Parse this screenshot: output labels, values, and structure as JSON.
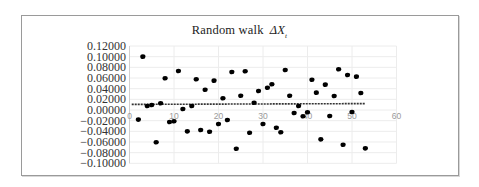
{
  "chart_data": {
    "type": "scatter",
    "title": "Random walk",
    "title_math": "ΔX",
    "title_subscript": "t",
    "xlabel": "",
    "ylabel": "",
    "xlim": [
      0,
      60
    ],
    "ylim": [
      -0.1,
      0.12
    ],
    "x_ticks": [
      0,
      10,
      20,
      30,
      40,
      50,
      60
    ],
    "y_ticks": [
      0.12,
      0.1,
      0.08,
      0.06,
      0.04,
      0.02,
      0.0,
      -0.02,
      -0.04,
      -0.06,
      -0.08,
      -0.1
    ],
    "y_tick_labels": [
      "0.12000",
      "0.10000",
      "0.08000",
      "0.06000",
      "0.04000",
      "0.02000",
      "0.00000",
      "−0.02000",
      "−0.04000",
      "−0.06000",
      "−0.08000",
      "−0.10000"
    ],
    "grid": true,
    "legend": null,
    "marker_color": "#000000",
    "series": [
      {
        "name": "ΔX_t",
        "x": [
          2,
          3,
          4,
          5,
          6,
          7,
          8,
          9,
          10,
          11,
          12,
          13,
          14,
          15,
          16,
          17,
          18,
          19,
          20,
          21,
          22,
          23,
          24,
          25,
          26,
          27,
          28,
          29,
          30,
          31,
          32,
          33,
          34,
          35,
          36,
          37,
          38,
          39,
          40,
          41,
          42,
          43,
          44,
          45,
          46,
          47,
          48,
          49,
          50,
          51,
          52,
          53
        ],
        "y": [
          -0.018,
          0.1,
          0.0075,
          0.0094,
          -0.0606,
          0.0126,
          0.0595,
          -0.0225,
          -0.0212,
          0.0732,
          0.0019,
          -0.04,
          0.0075,
          0.0576,
          -0.0375,
          0.038,
          -0.0407,
          0.055,
          -0.0263,
          0.022,
          -0.0188,
          0.0713,
          -0.0726,
          0.0268,
          0.0726,
          -0.0426,
          0.0137,
          0.0356,
          -0.0263,
          0.0418,
          0.0482,
          -0.0332,
          -0.0418,
          0.075,
          0.0268,
          -0.0056,
          0.0075,
          -0.0118,
          -0.0043,
          0.0568,
          0.0325,
          -0.055,
          0.0475,
          -0.0113,
          0.0263,
          0.0764,
          -0.0651,
          0.0657,
          -0.0038,
          0.0625,
          0.0319,
          -0.0719
        ]
      }
    ],
    "trendline": {
      "style": "dashed",
      "color": "#333333",
      "x_range": [
        0.5,
        53
      ],
      "y_start": 0.0105,
      "y_end": 0.012
    }
  }
}
